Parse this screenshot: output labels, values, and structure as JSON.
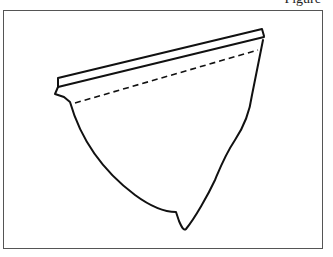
{
  "figure": {
    "caption": "Figure",
    "stroke_color": "#111111",
    "frame_color": "#555555"
  }
}
